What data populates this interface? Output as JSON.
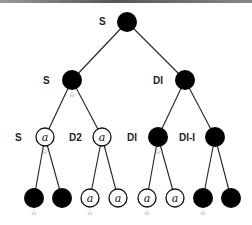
{
  "diagram": {
    "type": "binary-tree",
    "node_glyph": "a",
    "marker_glyph": "☆",
    "colors": {
      "filled": "#000000",
      "outline": "#111111",
      "edge": "#222222",
      "background": "#ffffff"
    },
    "nodes": [
      {
        "id": "n0",
        "x": 127,
        "y": 22,
        "filled": true,
        "label": "S",
        "marked": false
      },
      {
        "id": "n1",
        "x": 72,
        "y": 80,
        "filled": true,
        "label": "S",
        "marked": true
      },
      {
        "id": "n2",
        "x": 185,
        "y": 80,
        "filled": true,
        "label": "DI",
        "marked": false
      },
      {
        "id": "n3",
        "x": 45,
        "y": 137,
        "filled": false,
        "label": "S",
        "marked": true
      },
      {
        "id": "n4",
        "x": 102,
        "y": 137,
        "filled": false,
        "label": "D2",
        "marked": false
      },
      {
        "id": "n5",
        "x": 158,
        "y": 137,
        "filled": true,
        "label": "DI",
        "marked": true
      },
      {
        "id": "n6",
        "x": 215,
        "y": 137,
        "filled": true,
        "label": "DI-I",
        "marked": false
      },
      {
        "id": "n7",
        "x": 34,
        "y": 198,
        "filled": true,
        "label": "",
        "marked": true
      },
      {
        "id": "n8",
        "x": 62,
        "y": 198,
        "filled": true,
        "label": "",
        "marked": false
      },
      {
        "id": "n9",
        "x": 90,
        "y": 198,
        "filled": false,
        "label": "",
        "marked": true
      },
      {
        "id": "n10",
        "x": 118,
        "y": 198,
        "filled": false,
        "label": "",
        "marked": false
      },
      {
        "id": "n11",
        "x": 147,
        "y": 198,
        "filled": false,
        "label": "",
        "marked": true
      },
      {
        "id": "n12",
        "x": 175,
        "y": 198,
        "filled": false,
        "label": "",
        "marked": false
      },
      {
        "id": "n13",
        "x": 203,
        "y": 198,
        "filled": true,
        "label": "",
        "marked": true
      },
      {
        "id": "n14",
        "x": 231,
        "y": 198,
        "filled": true,
        "label": "",
        "marked": false
      }
    ],
    "edges": [
      [
        "n0",
        "n1"
      ],
      [
        "n0",
        "n2"
      ],
      [
        "n1",
        "n3"
      ],
      [
        "n1",
        "n4"
      ],
      [
        "n2",
        "n5"
      ],
      [
        "n2",
        "n6"
      ],
      [
        "n3",
        "n7"
      ],
      [
        "n3",
        "n8"
      ],
      [
        "n4",
        "n9"
      ],
      [
        "n4",
        "n10"
      ],
      [
        "n5",
        "n11"
      ],
      [
        "n5",
        "n12"
      ],
      [
        "n6",
        "n13"
      ],
      [
        "n6",
        "n14"
      ]
    ],
    "labels": [
      {
        "text": "S",
        "x": 99,
        "y": 25
      },
      {
        "text": "S",
        "x": 43,
        "y": 84
      },
      {
        "text": "DI",
        "x": 153,
        "y": 84
      },
      {
        "text": "S",
        "x": 15,
        "y": 141
      },
      {
        "text": "D2",
        "x": 69,
        "y": 141
      },
      {
        "text": "DI",
        "x": 127,
        "y": 141
      },
      {
        "text": "DI-I",
        "x": 179,
        "y": 141
      }
    ]
  }
}
